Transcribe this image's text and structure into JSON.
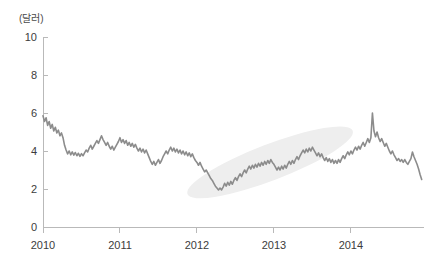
{
  "chart_data": {
    "type": "line",
    "title": "",
    "subtitle": "",
    "xlabel": "",
    "ylabel": "(달러)",
    "unit_label": "(달러)",
    "grid": false,
    "legend_position": "none",
    "xlim": [
      2010.0,
      2014.95
    ],
    "ylim": [
      0,
      10
    ],
    "y_ticks": [
      "10",
      "8",
      "6",
      "4",
      "2",
      "0"
    ],
    "y_tick_values": [
      10,
      8,
      6,
      4,
      2,
      0
    ],
    "x_ticks": [
      "2010",
      "2011",
      "2012",
      "2013",
      "2014"
    ],
    "x_tick_values": [
      2010,
      2011,
      2012,
      2013,
      2014
    ],
    "annotations": [
      {
        "name": "uptrend-highlight-ellipse",
        "shape": "ellipse",
        "color": "#eeeeee",
        "cx": 2012.95,
        "cy": 3.4,
        "rx": 1.15,
        "ry": 0.95,
        "rotation_deg": -21,
        "label": ""
      }
    ],
    "series": [
      {
        "name": "price",
        "color": "#8c8c8c",
        "x": [
          2010.0,
          2010.02,
          2010.04,
          2010.06,
          2010.08,
          2010.1,
          2010.12,
          2010.14,
          2010.16,
          2010.18,
          2010.2,
          2010.22,
          2010.24,
          2010.26,
          2010.28,
          2010.3,
          2010.32,
          2010.34,
          2010.36,
          2010.38,
          2010.4,
          2010.42,
          2010.44,
          2010.46,
          2010.48,
          2010.5,
          2010.52,
          2010.54,
          2010.56,
          2010.58,
          2010.6,
          2010.62,
          2010.64,
          2010.66,
          2010.68,
          2010.7,
          2010.72,
          2010.74,
          2010.76,
          2010.78,
          2010.8,
          2010.82,
          2010.84,
          2010.86,
          2010.88,
          2010.9,
          2010.92,
          2010.94,
          2010.96,
          2010.98,
          2011.0,
          2011.02,
          2011.04,
          2011.06,
          2011.08,
          2011.1,
          2011.12,
          2011.14,
          2011.16,
          2011.18,
          2011.2,
          2011.22,
          2011.24,
          2011.26,
          2011.28,
          2011.3,
          2011.32,
          2011.34,
          2011.36,
          2011.38,
          2011.4,
          2011.42,
          2011.44,
          2011.46,
          2011.48,
          2011.5,
          2011.52,
          2011.54,
          2011.56,
          2011.58,
          2011.6,
          2011.62,
          2011.64,
          2011.66,
          2011.68,
          2011.7,
          2011.72,
          2011.74,
          2011.76,
          2011.78,
          2011.8,
          2011.82,
          2011.84,
          2011.86,
          2011.88,
          2011.9,
          2011.92,
          2011.94,
          2011.96,
          2011.98,
          2012.0,
          2012.02,
          2012.04,
          2012.06,
          2012.08,
          2012.1,
          2012.12,
          2012.14,
          2012.16,
          2012.18,
          2012.2,
          2012.22,
          2012.24,
          2012.26,
          2012.28,
          2012.3,
          2012.32,
          2012.34,
          2012.36,
          2012.38,
          2012.4,
          2012.42,
          2012.44,
          2012.46,
          2012.48,
          2012.5,
          2012.52,
          2012.54,
          2012.56,
          2012.58,
          2012.6,
          2012.62,
          2012.64,
          2012.66,
          2012.68,
          2012.7,
          2012.72,
          2012.74,
          2012.76,
          2012.78,
          2012.8,
          2012.82,
          2012.84,
          2012.86,
          2012.88,
          2012.9,
          2012.92,
          2012.94,
          2012.96,
          2012.98,
          2013.0,
          2013.02,
          2013.04,
          2013.06,
          2013.08,
          2013.1,
          2013.12,
          2013.14,
          2013.16,
          2013.18,
          2013.2,
          2013.22,
          2013.24,
          2013.26,
          2013.28,
          2013.3,
          2013.32,
          2013.34,
          2013.36,
          2013.38,
          2013.4,
          2013.42,
          2013.44,
          2013.46,
          2013.48,
          2013.5,
          2013.52,
          2013.54,
          2013.56,
          2013.58,
          2013.6,
          2013.62,
          2013.64,
          2013.66,
          2013.68,
          2013.7,
          2013.72,
          2013.74,
          2013.76,
          2013.78,
          2013.8,
          2013.82,
          2013.84,
          2013.86,
          2013.88,
          2013.9,
          2013.92,
          2013.94,
          2013.96,
          2013.98,
          2014.0,
          2014.02,
          2014.04,
          2014.06,
          2014.08,
          2014.1,
          2014.12,
          2014.14,
          2014.16,
          2014.18,
          2014.2,
          2014.22,
          2014.24,
          2014.26,
          2014.28,
          2014.3,
          2014.32,
          2014.34,
          2014.36,
          2014.38,
          2014.4,
          2014.42,
          2014.44,
          2014.46,
          2014.48,
          2014.5,
          2014.52,
          2014.54,
          2014.56,
          2014.58,
          2014.6,
          2014.62,
          2014.64,
          2014.66,
          2014.68,
          2014.7,
          2014.72,
          2014.74,
          2014.76,
          2014.78,
          2014.8,
          2014.82,
          2014.84,
          2014.86,
          2014.88,
          2014.9,
          2014.92
        ],
        "y": [
          5.85,
          5.55,
          5.75,
          5.35,
          5.55,
          5.2,
          5.4,
          5.05,
          5.25,
          4.95,
          5.1,
          4.8,
          4.95,
          4.7,
          4.3,
          4.05,
          3.85,
          4.0,
          3.8,
          3.95,
          3.78,
          3.92,
          3.75,
          3.88,
          3.72,
          3.86,
          3.75,
          3.9,
          4.05,
          3.95,
          4.15,
          4.3,
          4.1,
          4.25,
          4.4,
          4.55,
          4.4,
          4.6,
          4.8,
          4.6,
          4.45,
          4.3,
          4.45,
          4.25,
          4.1,
          4.25,
          4.05,
          4.2,
          4.35,
          4.5,
          4.7,
          4.45,
          4.6,
          4.4,
          4.55,
          4.3,
          4.45,
          4.25,
          4.4,
          4.2,
          4.35,
          4.15,
          4.0,
          4.15,
          3.95,
          4.1,
          3.9,
          4.05,
          3.85,
          3.65,
          3.45,
          3.3,
          3.45,
          3.25,
          3.4,
          3.55,
          3.35,
          3.5,
          3.7,
          3.85,
          4.0,
          3.85,
          4.05,
          4.2,
          4.0,
          4.15,
          3.95,
          4.1,
          3.9,
          4.05,
          3.85,
          4.0,
          3.8,
          3.95,
          3.75,
          3.9,
          3.7,
          3.85,
          3.65,
          3.5,
          3.4,
          3.25,
          3.4,
          3.2,
          3.05,
          2.9,
          3.0,
          2.85,
          2.7,
          2.55,
          2.45,
          2.3,
          2.15,
          2.05,
          1.95,
          2.05,
          1.95,
          2.1,
          2.3,
          2.15,
          2.35,
          2.2,
          2.4,
          2.25,
          2.45,
          2.6,
          2.45,
          2.65,
          2.8,
          2.65,
          2.85,
          3.0,
          2.85,
          3.05,
          3.2,
          3.05,
          3.25,
          3.1,
          3.3,
          3.15,
          3.35,
          3.2,
          3.4,
          3.25,
          3.45,
          3.3,
          3.5,
          3.35,
          3.55,
          3.4,
          3.3,
          3.15,
          3.0,
          3.15,
          3.0,
          3.2,
          3.05,
          3.25,
          3.1,
          3.3,
          3.45,
          3.3,
          3.5,
          3.35,
          3.55,
          3.7,
          3.55,
          3.75,
          3.9,
          4.05,
          3.9,
          4.1,
          3.95,
          4.15,
          4.0,
          4.2,
          4.05,
          3.9,
          3.75,
          3.9,
          3.7,
          3.85,
          3.65,
          3.5,
          3.65,
          3.45,
          3.6,
          3.4,
          3.55,
          3.35,
          3.5,
          3.35,
          3.55,
          3.4,
          3.6,
          3.75,
          3.6,
          3.8,
          3.95,
          3.8,
          4.0,
          3.85,
          4.05,
          4.2,
          4.05,
          4.25,
          4.1,
          4.3,
          4.45,
          4.25,
          4.45,
          4.65,
          4.45,
          4.7,
          6.0,
          5.05,
          4.75,
          5.0,
          4.7,
          4.5,
          4.65,
          4.45,
          4.25,
          4.4,
          4.2,
          4.0,
          3.85,
          4.0,
          3.8,
          3.65,
          3.5,
          3.6,
          3.45,
          3.55,
          3.4,
          3.55,
          3.4,
          3.3,
          3.45,
          3.6,
          3.95,
          3.7,
          3.5,
          3.3,
          3.05,
          2.75,
          2.5
        ]
      }
    ]
  }
}
